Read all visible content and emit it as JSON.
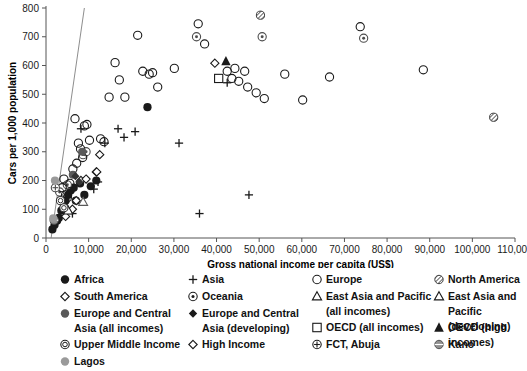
{
  "chart_data": {
    "type": "scatter",
    "title": "",
    "xlabel": "Gross national income per capita (US$)",
    "ylabel": "Cars per 1,000 population",
    "xlim": [
      0,
      110000
    ],
    "ylim": [
      0,
      800
    ],
    "xticks": [
      0,
      10000,
      20000,
      30000,
      40000,
      50000,
      60000,
      70000,
      80000,
      90000,
      100000,
      110000
    ],
    "xticklabels": [
      "0",
      "10,000",
      "20,000",
      "30,000",
      "40,000",
      "50,000",
      "60,000",
      "70,000",
      "80,000",
      "90,000",
      "100,000",
      "110,000"
    ],
    "yticks": [
      0,
      100,
      200,
      300,
      400,
      500,
      600,
      700,
      800
    ],
    "yticklabels": [
      "0",
      "100",
      "200",
      "300",
      "400",
      "500",
      "600",
      "700",
      "800"
    ],
    "grid": false,
    "legend_position": "below",
    "trendline": {
      "x0": 1200,
      "y0": 0,
      "x1": 9000,
      "y1": 800,
      "color": "#808080"
    },
    "series": [
      {
        "name": "Africa",
        "marker": "filled-circle",
        "color": "#1a1a1a",
        "points": [
          [
            1500,
            30
          ],
          [
            2000,
            45
          ],
          [
            2600,
            60
          ],
          [
            3000,
            70
          ],
          [
            3600,
            95
          ],
          [
            4200,
            110
          ],
          [
            4600,
            130
          ],
          [
            5200,
            150
          ],
          [
            5800,
            165
          ],
          [
            6500,
            175
          ],
          [
            7000,
            130
          ],
          [
            8000,
            190
          ],
          [
            9000,
            150
          ],
          [
            10500,
            180
          ],
          [
            11800,
            200
          ],
          [
            23800,
            455
          ]
        ]
      },
      {
        "name": "Asia",
        "marker": "plus",
        "color": "#1a1a1a",
        "points": [
          [
            6200,
            85
          ],
          [
            8200,
            380
          ],
          [
            11200,
            170
          ],
          [
            12200,
            195
          ],
          [
            13800,
            330
          ],
          [
            16900,
            380
          ],
          [
            18300,
            350
          ],
          [
            20900,
            370
          ],
          [
            31200,
            330
          ],
          [
            36000,
            85
          ],
          [
            42500,
            540
          ],
          [
            47600,
            150
          ]
        ]
      },
      {
        "name": "South America",
        "marker": "open-diamond",
        "color": "#1a1a1a",
        "points": [
          [
            4600,
            75
          ],
          [
            6200,
            100
          ],
          [
            7100,
            130
          ],
          [
            8200,
            200
          ],
          [
            9400,
            205
          ],
          [
            11800,
            230
          ],
          [
            12600,
            290
          ]
        ]
      },
      {
        "name": "Oceania",
        "marker": "circle-dot",
        "color": "#4d4d4d",
        "points": [
          [
            3200,
            160
          ],
          [
            5000,
            185
          ],
          [
            8700,
            290
          ],
          [
            9400,
            300
          ],
          [
            35300,
            700
          ],
          [
            50700,
            700
          ],
          [
            74500,
            695
          ]
        ]
      },
      {
        "name": "Europe",
        "marker": "open-circle",
        "color": "#1a1a1a",
        "points": [
          [
            3800,
            175
          ],
          [
            4200,
            205
          ],
          [
            4600,
            150
          ],
          [
            5000,
            140
          ],
          [
            5600,
            190
          ],
          [
            6300,
            240
          ],
          [
            6800,
            415
          ],
          [
            7200,
            260
          ],
          [
            7600,
            330
          ],
          [
            8100,
            310
          ],
          [
            8600,
            280
          ],
          [
            9000,
            390
          ],
          [
            9600,
            395
          ],
          [
            10200,
            340
          ],
          [
            12800,
            345
          ],
          [
            13600,
            335
          ],
          [
            14800,
            490
          ],
          [
            16200,
            610
          ],
          [
            17200,
            550
          ],
          [
            18500,
            490
          ],
          [
            21500,
            705
          ],
          [
            22700,
            580
          ],
          [
            24200,
            570
          ],
          [
            25000,
            575
          ],
          [
            26200,
            525
          ],
          [
            30100,
            590
          ],
          [
            35700,
            745
          ],
          [
            37200,
            675
          ],
          [
            42500,
            580
          ],
          [
            43600,
            555
          ],
          [
            44300,
            590
          ],
          [
            45200,
            545
          ],
          [
            46600,
            580
          ],
          [
            47300,
            525
          ],
          [
            49300,
            505
          ],
          [
            51200,
            485
          ],
          [
            56000,
            570
          ],
          [
            60200,
            480
          ],
          [
            66500,
            560
          ],
          [
            73700,
            735
          ],
          [
            88500,
            585
          ]
        ]
      },
      {
        "name": "North America",
        "marker": "hatched-circle",
        "color": "#4d4d4d",
        "points": [
          [
            50300,
            775
          ],
          [
            105000,
            420
          ]
        ]
      },
      {
        "name": "Europe and Central Asia (all incomes)",
        "marker": "filled-circle-gray",
        "color": "#595959",
        "points": [
          [
            6300,
            220
          ],
          [
            8500,
            300
          ]
        ]
      },
      {
        "name": "Europe and Central Asia (developing)",
        "marker": "filled-diamond",
        "color": "#333333",
        "points": [
          [
            6900,
            215
          ],
          [
            7800,
            195
          ]
        ]
      },
      {
        "name": "East Asia and Pacific (all incomes)",
        "marker": "open-triangle",
        "color": "#595959",
        "points": [
          [
            8700,
            125
          ]
        ]
      },
      {
        "name": "East Asia and Pacific (developing)",
        "marker": "open-triangle",
        "color": "#1a1a1a",
        "points": [
          [
            5200,
            95
          ]
        ]
      },
      {
        "name": "OECD (all incomes)",
        "marker": "open-square",
        "color": "#1a1a1a",
        "points": [
          [
            40500,
            555
          ]
        ]
      },
      {
        "name": "OECD (high incomes)",
        "marker": "filled-triangle",
        "color": "#1a1a1a",
        "points": [
          [
            42200,
            615
          ]
        ]
      },
      {
        "name": "Upper Middle Income",
        "marker": "double-circle",
        "color": "#333333",
        "points": [
          [
            3400,
            130
          ],
          [
            4200,
            105
          ]
        ]
      },
      {
        "name": "High Income",
        "marker": "open-diamond-sm",
        "color": "#1a1a1a",
        "points": [
          [
            11900,
            230
          ],
          [
            39600,
            608
          ]
        ]
      },
      {
        "name": "FCT, Abuja",
        "marker": "circle-bar",
        "color": "#4d4d4d",
        "points": [
          [
            2200,
            175
          ]
        ]
      },
      {
        "name": "Kano",
        "marker": "circle-hline",
        "color": "#4d4d4d",
        "points": [
          [
            1900,
            62
          ]
        ]
      },
      {
        "name": "Lagos",
        "marker": "filled-circle-lt",
        "color": "#9a9a9a",
        "points": [
          [
            2100,
            200
          ],
          [
            1700,
            68
          ]
        ]
      }
    ]
  },
  "legend": {
    "columns": [
      {
        "items": [
          {
            "marker": "filled-circle",
            "label": "Africa"
          },
          {
            "marker": "open-diamond",
            "label": "South America"
          },
          {
            "marker": "filled-circle-gray",
            "label": "Europe and Central\nAsia (all incomes)"
          },
          {
            "marker": "double-circle",
            "label": "Upper Middle Income"
          },
          {
            "marker": "filled-circle-lt",
            "label": "Lagos"
          }
        ]
      },
      {
        "items": [
          {
            "marker": "plus",
            "label": "Asia"
          },
          {
            "marker": "circle-dot",
            "label": "Oceania"
          },
          {
            "marker": "filled-diamond",
            "label": "Europe and Central\nAsia (developing)"
          },
          {
            "marker": "open-diamond-sm",
            "label": "High Income"
          }
        ]
      },
      {
        "items": [
          {
            "marker": "open-circle",
            "label": "Europe"
          },
          {
            "marker": "open-triangle",
            "label": "East Asia and Pacific\n(all incomes)"
          },
          {
            "marker": "open-square",
            "label": "OECD (all incomes)"
          },
          {
            "marker": "circle-bar",
            "label": "FCT, Abuja"
          }
        ]
      },
      {
        "items": [
          {
            "marker": "hatched-circle",
            "label": "North America"
          },
          {
            "marker": "open-triangle",
            "label": "East Asia and Pacific\n(developing)"
          },
          {
            "marker": "filled-triangle",
            "label": "OECD (high incomes)"
          },
          {
            "marker": "circle-hline",
            "label": "Kano"
          }
        ]
      }
    ]
  }
}
